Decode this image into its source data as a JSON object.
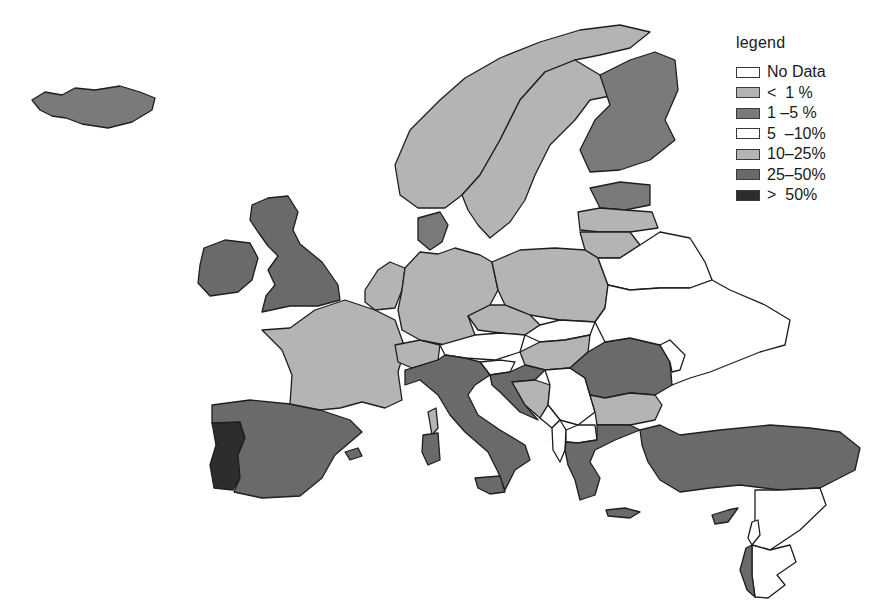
{
  "legend": {
    "title": "legend",
    "classes": [
      {
        "id": "nodata",
        "label": "No Data",
        "color": "#ffffff"
      },
      {
        "id": "lt1",
        "label": "<  1 %",
        "color": "#b4b4b4"
      },
      {
        "id": "c1_5",
        "label": "1 –5 %",
        "color": "#7a7a7a"
      },
      {
        "id": "c5_10",
        "label": "5  –10%",
        "color": "#ffffff"
      },
      {
        "id": "c10_25",
        "label": "10–25%",
        "color": "#b4b4b4"
      },
      {
        "id": "c25_50",
        "label": "25–50%",
        "color": "#6a6a6a"
      },
      {
        "id": "gt50",
        "label": ">  50%",
        "color": "#2d2d2d"
      }
    ]
  },
  "countries": [
    {
      "name": "Iceland",
      "class": "c1_5"
    },
    {
      "name": "Ireland",
      "class": "c25_50"
    },
    {
      "name": "United Kingdom",
      "class": "c25_50"
    },
    {
      "name": "Portugal",
      "class": "gt50"
    },
    {
      "name": "Spain",
      "class": "c25_50"
    },
    {
      "name": "France",
      "class": "c10_25"
    },
    {
      "name": "Belgium",
      "class": "c10_25"
    },
    {
      "name": "Netherlands",
      "class": "c10_25"
    },
    {
      "name": "Luxembourg",
      "class": "c10_25"
    },
    {
      "name": "Switzerland",
      "class": "c10_25"
    },
    {
      "name": "Germany",
      "class": "c10_25"
    },
    {
      "name": "Denmark",
      "class": "c1_5"
    },
    {
      "name": "Norway",
      "class": "c10_25"
    },
    {
      "name": "Sweden",
      "class": "c10_25"
    },
    {
      "name": "Finland",
      "class": "c1_5"
    },
    {
      "name": "Estonia",
      "class": "c1_5"
    },
    {
      "name": "Latvia",
      "class": "c10_25"
    },
    {
      "name": "Lithuania",
      "class": "c10_25"
    },
    {
      "name": "Poland",
      "class": "c10_25"
    },
    {
      "name": "Czech Republic",
      "class": "c10_25"
    },
    {
      "name": "Slovakia",
      "class": "c5_10"
    },
    {
      "name": "Austria",
      "class": "c5_10"
    },
    {
      "name": "Hungary",
      "class": "c10_25"
    },
    {
      "name": "Slovenia",
      "class": "c5_10"
    },
    {
      "name": "Croatia",
      "class": "c25_50"
    },
    {
      "name": "Bosnia and Herzegovina",
      "class": "c10_25"
    },
    {
      "name": "Serbia",
      "class": "nodata"
    },
    {
      "name": "Montenegro",
      "class": "nodata"
    },
    {
      "name": "Albania",
      "class": "nodata"
    },
    {
      "name": "North Macedonia",
      "class": "nodata"
    },
    {
      "name": "Romania",
      "class": "c25_50"
    },
    {
      "name": "Bulgaria",
      "class": "c10_25"
    },
    {
      "name": "Greece",
      "class": "c25_50"
    },
    {
      "name": "Turkey",
      "class": "c25_50"
    },
    {
      "name": "Cyprus",
      "class": "c25_50"
    },
    {
      "name": "Italy",
      "class": "c25_50"
    },
    {
      "name": "Belarus",
      "class": "nodata"
    },
    {
      "name": "Ukraine",
      "class": "nodata"
    },
    {
      "name": "Moldova",
      "class": "nodata"
    },
    {
      "name": "Israel",
      "class": "c25_50"
    },
    {
      "name": "Lebanon",
      "class": "nodata"
    },
    {
      "name": "Syria",
      "class": "nodata"
    },
    {
      "name": "Jordan",
      "class": "nodata"
    }
  ]
}
